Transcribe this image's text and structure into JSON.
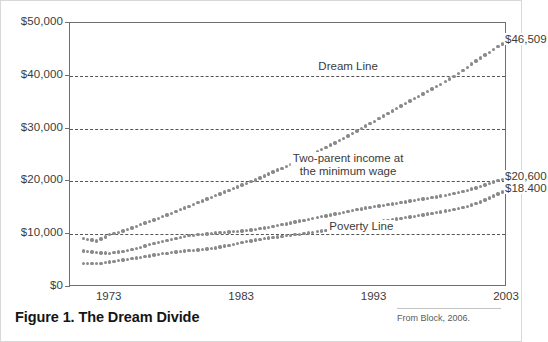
{
  "figure": {
    "caption": "Figure 1. The Dream Divide",
    "source_text": "From Block, 2006."
  },
  "chart_data": {
    "type": "scatter",
    "title": "Figure 1. The Dream Divide",
    "xlabel": "",
    "ylabel": "",
    "xlim": [
      1970,
      2003
    ],
    "ylim": [
      0,
      50000
    ],
    "grid": true,
    "grid_axis": "y",
    "legend": "inline-annotations",
    "marker": "dotted",
    "marker_color": "#8a8a8a",
    "x_ticks": [
      1973,
      1983,
      1993,
      2003
    ],
    "x_tick_labels": [
      "1973",
      "1983",
      "1993",
      "2003"
    ],
    "y_ticks": [
      0,
      10000,
      20000,
      30000,
      40000,
      50000
    ],
    "y_tick_labels": [
      "$0",
      "$10,000",
      "$20,000",
      "$30,000",
      "$40,000",
      "$50,000"
    ],
    "annotations": [
      {
        "text": "Dream Line",
        "x": 1991,
        "y": 41600
      },
      {
        "text": "Two-parent income at\nthe minimum wage",
        "x": 1991,
        "y": 24200
      },
      {
        "text": "Poverty Line",
        "x": 1992,
        "y": 11300
      }
    ],
    "end_labels": [
      {
        "text": "$46,509",
        "series": "Dream Line",
        "value": 46509
      },
      {
        "text": "$20,600",
        "series": "Two-parent income at the minimum wage",
        "value": 20600
      },
      {
        "text": "$18.400",
        "series": "Poverty Line",
        "value": 18400
      }
    ],
    "x": [
      1971,
      1972,
      1973,
      1974,
      1975,
      1976,
      1977,
      1978,
      1979,
      1980,
      1981,
      1982,
      1983,
      1984,
      1985,
      1986,
      1987,
      1988,
      1989,
      1990,
      1991,
      1992,
      1993,
      1994,
      1995,
      1996,
      1997,
      1998,
      1999,
      2000,
      2001,
      2002,
      2003
    ],
    "series": [
      {
        "name": "Dream Line",
        "end_value": 46509,
        "values": [
          9200,
          8700,
          9900,
          10600,
          11500,
          12400,
          13300,
          14300,
          15300,
          16300,
          17300,
          18300,
          19300,
          20300,
          21400,
          22500,
          23600,
          24800,
          26000,
          27300,
          28600,
          30000,
          31400,
          32900,
          34300,
          35700,
          37000,
          38400,
          39900,
          41600,
          43400,
          45000,
          46509
        ]
      },
      {
        "name": "Two-parent income at the minimum wage",
        "end_value": 20600,
        "values": [
          6800,
          6500,
          6400,
          6700,
          7300,
          8000,
          8600,
          9200,
          9700,
          10000,
          10200,
          10400,
          10600,
          10900,
          11300,
          11800,
          12300,
          12800,
          13300,
          13800,
          14300,
          14800,
          15200,
          15600,
          16000,
          16400,
          16800,
          17200,
          17700,
          18300,
          19000,
          19900,
          20600
        ]
      },
      {
        "name": "Poverty Line",
        "end_value": 18400,
        "values": [
          4500,
          4400,
          4700,
          5100,
          5500,
          5900,
          6300,
          6600,
          6900,
          7100,
          7400,
          7900,
          8400,
          8900,
          9300,
          9600,
          9900,
          10200,
          10600,
          11000,
          11400,
          11800,
          12200,
          12600,
          13000,
          13400,
          13800,
          14200,
          14700,
          15300,
          16100,
          17200,
          18400
        ]
      }
    ]
  }
}
